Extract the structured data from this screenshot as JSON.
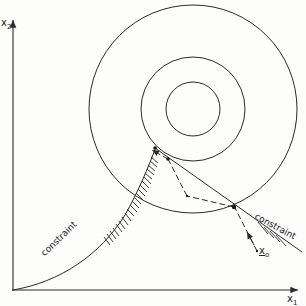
{
  "diagram": {
    "axes": {
      "x_label": "x",
      "x_sub": "1",
      "y_label": "x",
      "y_sub": "2"
    },
    "contours": {
      "center": [
        193,
        109
      ],
      "radii": [
        104,
        52,
        27
      ]
    },
    "constraints": [
      {
        "label": "constraint",
        "kind": "curve",
        "side": "left"
      },
      {
        "label": "constraint",
        "kind": "line",
        "side": "right"
      }
    ],
    "start_point": {
      "label": "x",
      "sub": "o"
    },
    "colors": {
      "ink": "#2a2a2a",
      "background": "#fdfdfc"
    }
  }
}
